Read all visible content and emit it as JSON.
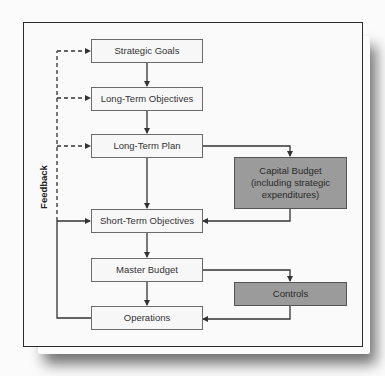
{
  "diagram": {
    "feedback_label": "Feedback",
    "main_flow": [
      {
        "id": "strategic-goals",
        "label": "Strategic Goals"
      },
      {
        "id": "long-term-objectives",
        "label": "Long-Term Objectives"
      },
      {
        "id": "long-term-plan",
        "label": "Long-Term Plan"
      },
      {
        "id": "short-term-objectives",
        "label": "Short-Term Objectives"
      },
      {
        "id": "master-budget",
        "label": "Master Budget"
      },
      {
        "id": "operations",
        "label": "Operations"
      }
    ],
    "side_boxes": [
      {
        "id": "capital-budget",
        "label": "Capital Budget (including strategic expenditures)",
        "lines": [
          "Capital Budget",
          "(including strategic",
          "expenditures)"
        ]
      },
      {
        "id": "controls",
        "label": "Controls"
      }
    ],
    "edges": [
      {
        "from": "strategic-goals",
        "to": "long-term-objectives",
        "style": "solid"
      },
      {
        "from": "long-term-objectives",
        "to": "long-term-plan",
        "style": "solid"
      },
      {
        "from": "long-term-plan",
        "to": "short-term-objectives",
        "style": "solid"
      },
      {
        "from": "long-term-plan",
        "to": "capital-budget",
        "style": "solid"
      },
      {
        "from": "capital-budget",
        "to": "short-term-objectives",
        "style": "solid"
      },
      {
        "from": "short-term-objectives",
        "to": "master-budget",
        "style": "solid"
      },
      {
        "from": "master-budget",
        "to": "operations",
        "style": "solid"
      },
      {
        "from": "master-budget",
        "to": "controls",
        "style": "solid"
      },
      {
        "from": "controls",
        "to": "operations",
        "style": "solid"
      },
      {
        "from": "operations",
        "to": "short-term-objectives",
        "style": "solid",
        "label": "Feedback"
      },
      {
        "from": "operations",
        "to": "long-term-plan",
        "style": "dashed",
        "label": "Feedback"
      },
      {
        "from": "operations",
        "to": "long-term-objectives",
        "style": "dashed",
        "label": "Feedback"
      },
      {
        "from": "operations",
        "to": "strategic-goals",
        "style": "dashed",
        "label": "Feedback"
      }
    ],
    "colors": {
      "box_fill": "#f7f7f7",
      "dark_box_fill": "#9b9b9b",
      "line": "#333333"
    }
  }
}
